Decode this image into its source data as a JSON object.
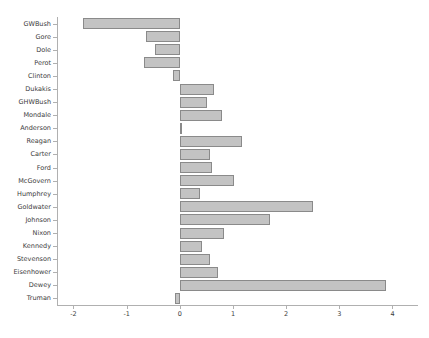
{
  "chart_data": {
    "type": "bar",
    "orientation": "horizontal",
    "title": "",
    "xlabel": "",
    "ylabel": "",
    "xlim": [
      -2.31,
      4.48
    ],
    "ylim": [
      0,
      23
    ],
    "grid": false,
    "legend": null,
    "xticks": [
      -2,
      -1,
      0,
      1,
      2,
      3,
      4
    ],
    "xticklabels": [
      "-2",
      "-1",
      "0",
      "1",
      "2",
      "3",
      "4"
    ],
    "bar_color": "#c3c3c3",
    "bar_edge_color": "#8a8a8a",
    "axis_color": "#b0b0b0",
    "text_color": "#3c3c3c",
    "categories": [
      "GWBush",
      "Gore",
      "Dole",
      "Perot",
      "Clinton",
      "Dukakis",
      "GHWBush",
      "Mondale",
      "Anderson",
      "Reagan",
      "Carter",
      "Ford",
      "McGovern",
      "Humphrey",
      "Goldwater",
      "Johnson",
      "Nixon",
      "Kennedy",
      "Stevenson",
      "Eisenhower",
      "Dewey",
      "Truman"
    ],
    "values": [
      -1.83,
      -0.64,
      -0.47,
      -0.68,
      -0.13,
      0.64,
      0.51,
      0.79,
      0.02,
      1.17,
      0.57,
      0.6,
      1.02,
      0.38,
      2.51,
      1.7,
      0.83,
      0.42,
      0.57,
      0.72,
      3.87,
      -0.09
    ]
  }
}
